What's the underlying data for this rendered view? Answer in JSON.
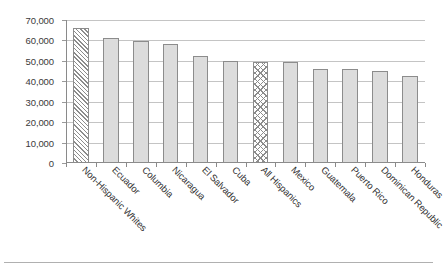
{
  "chart_data": {
    "type": "bar",
    "title": "",
    "subtitle": "",
    "xlabel": "",
    "ylabel": "",
    "ylim": [
      0,
      70000
    ],
    "ytick_interval": 10000,
    "ytick_labels": [
      "70,000",
      "60,000",
      "50,000",
      "40,000",
      "30,000",
      "20,000",
      "10,000",
      "0"
    ],
    "ytick_values": [
      70000,
      60000,
      50000,
      40000,
      30000,
      20000,
      10000,
      0
    ],
    "grid": true,
    "grid_axis": "y",
    "legend": "none",
    "categories": [
      "Non-Hispanic Whites",
      "Ecuador",
      "Columbia",
      "Nicaragua",
      "El Salvador",
      "Cuba",
      "All Hispanics",
      "Mexico",
      "Guatemala",
      "Puerto Rico",
      "Dominican Republic",
      "Honduras"
    ],
    "values": [
      66000,
      61000,
      59500,
      58500,
      52500,
      50000,
      49500,
      49500,
      46000,
      45800,
      45000,
      42500
    ],
    "bar_fills": [
      "diagonal",
      "solid",
      "solid",
      "solid",
      "solid",
      "solid",
      "crosshatch",
      "solid",
      "solid",
      "solid",
      "solid",
      "solid"
    ],
    "colors": {
      "bar_fill": "#dcdcdc",
      "bar_border": "#8c8c8c",
      "gridline": "#c4c4c4",
      "axis": "#8a8a8a",
      "text": "#333333",
      "background": "#ffffff"
    }
  }
}
